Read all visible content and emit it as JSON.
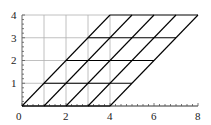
{
  "chart_data": {
    "type": "line",
    "title": "",
    "xlabel": "",
    "ylabel": "",
    "xlim": [
      0,
      8
    ],
    "ylim": [
      0,
      4
    ],
    "x_ticks": [
      "0",
      "2",
      "4",
      "6",
      "8"
    ],
    "y_ticks": [
      "0",
      "1",
      "2",
      "3",
      "4"
    ],
    "grid": true,
    "series": [
      {
        "name": "original-grid",
        "color": "#b0b0b0",
        "segments": [
          [
            [
              0,
              0
            ],
            [
              0,
              4
            ]
          ],
          [
            [
              1,
              0
            ],
            [
              1,
              4
            ]
          ],
          [
            [
              2,
              0
            ],
            [
              2,
              4
            ]
          ],
          [
            [
              3,
              0
            ],
            [
              3,
              4
            ]
          ],
          [
            [
              4,
              0
            ],
            [
              4,
              4
            ]
          ],
          [
            [
              0,
              0
            ],
            [
              4,
              0
            ]
          ],
          [
            [
              0,
              1
            ],
            [
              4,
              1
            ]
          ],
          [
            [
              0,
              2
            ],
            [
              4,
              2
            ]
          ],
          [
            [
              0,
              3
            ],
            [
              4,
              3
            ]
          ],
          [
            [
              0,
              4
            ],
            [
              4,
              4
            ]
          ]
        ]
      },
      {
        "name": "sheared-grid",
        "color": "#000000",
        "segments": [
          [
            [
              0,
              0
            ],
            [
              4,
              4
            ]
          ],
          [
            [
              1,
              0
            ],
            [
              5,
              4
            ]
          ],
          [
            [
              2,
              0
            ],
            [
              6,
              4
            ]
          ],
          [
            [
              3,
              0
            ],
            [
              7,
              4
            ]
          ],
          [
            [
              4,
              0
            ],
            [
              8,
              4
            ]
          ],
          [
            [
              0,
              0
            ],
            [
              4,
              0
            ]
          ],
          [
            [
              1,
              1
            ],
            [
              5,
              1
            ]
          ],
          [
            [
              2,
              2
            ],
            [
              6,
              2
            ]
          ],
          [
            [
              3,
              3
            ],
            [
              7,
              3
            ]
          ],
          [
            [
              4,
              4
            ],
            [
              8,
              4
            ]
          ]
        ]
      }
    ]
  }
}
